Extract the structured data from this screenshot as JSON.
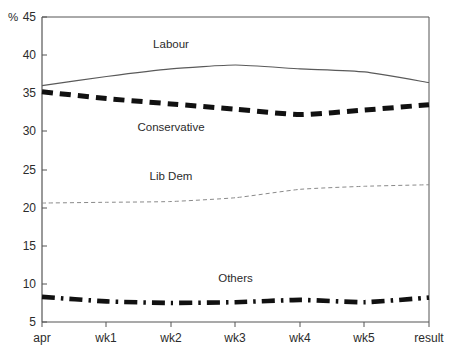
{
  "chart_data": {
    "type": "line",
    "title": "",
    "xlabel": "",
    "ylabel": "%",
    "unit_label": "%",
    "x": [
      "apr",
      "wk1",
      "wk2",
      "wk3",
      "wk4",
      "wk5",
      "result"
    ],
    "categories": [
      "apr",
      "wk1",
      "wk2",
      "wk3",
      "wk4",
      "wk5",
      "result"
    ],
    "yticks": [
      5,
      10,
      15,
      20,
      25,
      30,
      35,
      40,
      45
    ],
    "ylim": [
      5,
      45
    ],
    "grid": false,
    "legend_position": "inline-annotations",
    "series": [
      {
        "name": "Labour",
        "style": "solid",
        "color": "#5a5a5a",
        "values": [
          36.0,
          37.2,
          38.2,
          38.7,
          38.2,
          37.8,
          36.4
        ],
        "label_x": "wk2",
        "label_value": 41.0
      },
      {
        "name": "Conservative",
        "style": "thick-dashed",
        "color": "#111111",
        "values": [
          35.2,
          34.3,
          33.6,
          32.9,
          32.2,
          32.8,
          33.5
        ],
        "label_x": "wk2",
        "label_value": 30.0
      },
      {
        "name": "Lib Dem",
        "style": "fine-dashed",
        "color": "#8a8a8a",
        "values": [
          20.6,
          20.7,
          20.8,
          21.3,
          22.4,
          22.8,
          23.0
        ],
        "label_x": "wk2",
        "label_value": 23.6
      },
      {
        "name": "Others",
        "style": "dash-dot",
        "color": "#111111",
        "values": [
          8.3,
          7.7,
          7.5,
          7.6,
          7.9,
          7.6,
          8.2
        ],
        "label_x": "wk3",
        "label_value": 10.2
      }
    ]
  },
  "axis": {
    "y_tick_labels": [
      "45",
      "40",
      "35",
      "30",
      "25",
      "20",
      "15",
      "10",
      "5"
    ],
    "x_tick_labels": [
      "apr",
      "wk1",
      "wk2",
      "wk3",
      "wk4",
      "wk5",
      "result"
    ],
    "unit": "%"
  }
}
